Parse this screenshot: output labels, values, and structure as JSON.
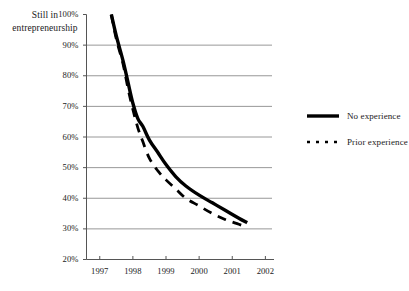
{
  "chart_data": {
    "type": "line",
    "title": "",
    "ylabel": "Still in entrepreneurship",
    "xlabel": "",
    "ylim": [
      20,
      100
    ],
    "xlim": [
      1996.6,
      2002.2
    ],
    "ytick_labels": [
      "100%",
      "90%",
      "80%",
      "70%",
      "60%",
      "50%",
      "40%",
      "30%",
      "20%"
    ],
    "ytick_values": [
      100,
      90,
      80,
      70,
      60,
      50,
      40,
      30,
      20
    ],
    "xtick_labels": [
      "1997",
      "1998",
      "1999",
      "2000",
      "2001",
      "2002"
    ],
    "xtick_values": [
      1997,
      1998,
      1999,
      2000,
      2001,
      2002
    ],
    "grid": "horizontal",
    "legend_position": "right",
    "series": [
      {
        "name": "No experience",
        "style": "solid",
        "color": "#000000",
        "x": [
          1997.35,
          1997.5,
          1997.7,
          1997.85,
          1998.0,
          1998.15,
          1998.3,
          1998.5,
          1998.75,
          1999.0,
          1999.3,
          1999.6,
          2000.0,
          2000.4,
          2000.8,
          2001.2,
          2001.45
        ],
        "y": [
          100,
          93,
          85,
          78,
          71,
          66,
          63.5,
          59,
          55,
          51,
          47,
          44,
          41,
          38.5,
          36,
          33.5,
          32
        ]
      },
      {
        "name": "Prior experience",
        "style": "dashed",
        "color": "#000000",
        "x": [
          1997.35,
          1997.5,
          1997.7,
          1997.85,
          1998.0,
          1998.15,
          1998.3,
          1998.5,
          1998.75,
          1999.0,
          1999.3,
          1999.6,
          2000.0,
          2000.4,
          2000.8,
          2001.2,
          2001.45
        ],
        "y": [
          100,
          92,
          84,
          76,
          69,
          63,
          58.5,
          53,
          49,
          46,
          43,
          40,
          37.5,
          35,
          33,
          31.5,
          30.5
        ]
      }
    ]
  },
  "legend": {
    "items": [
      {
        "label": "No experience",
        "style": "solid"
      },
      {
        "label": "Prior experience",
        "style": "dashed"
      }
    ]
  }
}
